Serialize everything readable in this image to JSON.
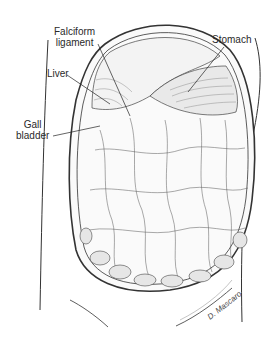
{
  "figure": {
    "type": "anatomical-illustration",
    "labels": {
      "falciform_ligament_line1": "Falciform",
      "falciform_ligament_line2": "ligament",
      "liver": "Liver",
      "gall_bladder_line1": "Gall",
      "gall_bladder_line2": "bladder",
      "stomach": "Stomach"
    },
    "signature": "D. Mascaro"
  },
  "colors": {
    "ink": "#2a2a2a",
    "background": "#ffffff"
  }
}
